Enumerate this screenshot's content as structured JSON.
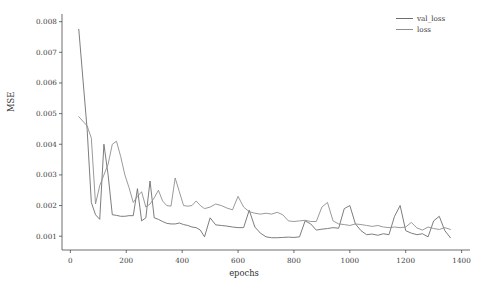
{
  "chart_data": {
    "type": "line",
    "title": "",
    "xlabel": "epochs",
    "ylabel": "MSE",
    "xlim": [
      -30,
      1430
    ],
    "ylim": [
      0.00055,
      0.00825
    ],
    "xticks": [
      0,
      200,
      400,
      600,
      800,
      1000,
      1200,
      1400
    ],
    "xtick_labels": [
      "0",
      "200",
      "400",
      "600",
      "800",
      "1000",
      "1200",
      "1400"
    ],
    "yticks": [
      0.001,
      0.002,
      0.003,
      0.004,
      0.005,
      0.006,
      0.007,
      0.008
    ],
    "ytick_labels": [
      "0.001",
      "0.002",
      "0.003",
      "0.004",
      "0.005",
      "0.006",
      "0.007",
      "0.008"
    ],
    "grid": false,
    "legend_position": "upper right",
    "colors": {
      "val_loss": "#6e6e6e",
      "loss": "#8f8f8f",
      "axis": "#4a4a4a",
      "background": "#ffffff"
    },
    "series": [
      {
        "name": "val_loss",
        "color": "#6e6e6e",
        "x": [
          30,
          60,
          75,
          90,
          105,
          120,
          135,
          150,
          165,
          180,
          195,
          210,
          225,
          240,
          255,
          270,
          285,
          300,
          315,
          330,
          345,
          360,
          375,
          390,
          405,
          420,
          435,
          450,
          465,
          480,
          500,
          520,
          540,
          560,
          580,
          600,
          620,
          640,
          660,
          680,
          700,
          720,
          740,
          760,
          780,
          800,
          820,
          840,
          860,
          880,
          900,
          920,
          940,
          960,
          980,
          1000,
          1020,
          1040,
          1060,
          1080,
          1100,
          1120,
          1140,
          1160,
          1180,
          1200,
          1220,
          1240,
          1260,
          1280,
          1300,
          1320,
          1340,
          1360
        ],
        "y": [
          0.00775,
          0.00448,
          0.0021,
          0.0017,
          0.00155,
          0.004,
          0.003,
          0.0017,
          0.00168,
          0.00165,
          0.00165,
          0.00167,
          0.00167,
          0.00255,
          0.0015,
          0.0016,
          0.0028,
          0.0016,
          0.00155,
          0.00148,
          0.00142,
          0.0014,
          0.0014,
          0.00143,
          0.00138,
          0.00135,
          0.0013,
          0.00128,
          0.0012,
          0.00098,
          0.0016,
          0.00137,
          0.00135,
          0.00133,
          0.0013,
          0.00128,
          0.00128,
          0.00185,
          0.0013,
          0.0011,
          0.00098,
          0.00095,
          0.00095,
          0.00096,
          0.00097,
          0.00096,
          0.00098,
          0.0015,
          0.0014,
          0.0012,
          0.00123,
          0.00125,
          0.00128,
          0.00126,
          0.0019,
          0.002,
          0.0014,
          0.00118,
          0.00105,
          0.00107,
          0.00103,
          0.00108,
          0.00105,
          0.00165,
          0.002,
          0.00118,
          0.0011,
          0.00105,
          0.00108,
          0.00098,
          0.0015,
          0.00165,
          0.00118,
          0.00095
        ],
        "linewidth": 0.9
      },
      {
        "name": "loss",
        "color": "#8f8f8f",
        "x": [
          30,
          60,
          75,
          90,
          105,
          120,
          135,
          150,
          165,
          180,
          195,
          210,
          225,
          240,
          255,
          270,
          285,
          300,
          315,
          330,
          345,
          360,
          375,
          390,
          405,
          420,
          435,
          450,
          465,
          480,
          500,
          520,
          540,
          560,
          580,
          600,
          620,
          640,
          660,
          680,
          700,
          720,
          740,
          760,
          780,
          800,
          820,
          840,
          860,
          880,
          900,
          920,
          940,
          960,
          980,
          1000,
          1020,
          1040,
          1060,
          1080,
          1100,
          1120,
          1140,
          1160,
          1180,
          1200,
          1220,
          1240,
          1260,
          1280,
          1300,
          1320,
          1340,
          1360
        ],
        "y": [
          0.0049,
          0.0046,
          0.0042,
          0.00205,
          0.00265,
          0.003,
          0.00335,
          0.004,
          0.0041,
          0.0036,
          0.003,
          0.00258,
          0.0021,
          0.0023,
          0.00245,
          0.00195,
          0.00205,
          0.00225,
          0.0025,
          0.00215,
          0.002,
          0.00198,
          0.0029,
          0.00245,
          0.002,
          0.00198,
          0.002,
          0.00215,
          0.002,
          0.0019,
          0.00195,
          0.00205,
          0.002,
          0.00192,
          0.00186,
          0.0023,
          0.00195,
          0.0018,
          0.00175,
          0.00172,
          0.00175,
          0.00172,
          0.00178,
          0.0017,
          0.0015,
          0.00148,
          0.0015,
          0.00152,
          0.00148,
          0.00148,
          0.00195,
          0.0021,
          0.0015,
          0.0014,
          0.00138,
          0.00135,
          0.0014,
          0.00138,
          0.00135,
          0.00132,
          0.00135,
          0.0013,
          0.00128,
          0.0013,
          0.00128,
          0.0013,
          0.00145,
          0.00127,
          0.0012,
          0.0013,
          0.00125,
          0.00122,
          0.00128,
          0.00122
        ],
        "linewidth": 0.9
      }
    ],
    "legend_entries": [
      {
        "label": "val_loss",
        "color": "#6e6e6e"
      },
      {
        "label": "loss",
        "color": "#8f8f8f"
      }
    ]
  }
}
